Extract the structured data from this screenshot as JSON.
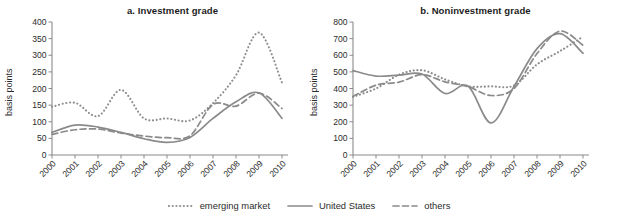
{
  "figure": {
    "yaxis_label": "basis points"
  },
  "legend": {
    "position": "bottom-center",
    "items": [
      {
        "label": "emerging market",
        "style": "dotted",
        "color": "#8e8e8e",
        "icon": "dotted-line-icon"
      },
      {
        "label": "United States",
        "style": "solid",
        "color": "#8a8a8a",
        "icon": "solid-line-icon"
      },
      {
        "label": "others",
        "style": "dashed",
        "color": "#8a8a8a",
        "icon": "dashed-line-icon"
      }
    ]
  },
  "chart_data": [
    {
      "type": "line",
      "title": "a. Investment grade",
      "xlabel": "",
      "ylabel": "basis points",
      "ylim": [
        0,
        400
      ],
      "ytick_step": 50,
      "yticks": [
        0,
        50,
        100,
        150,
        200,
        250,
        300,
        350,
        400
      ],
      "xlim": [
        2000,
        2010
      ],
      "categories": [
        "2000",
        "2001",
        "2002",
        "2003",
        "2004",
        "2005",
        "2006",
        "2007",
        "2008",
        "2009",
        "2010"
      ],
      "x": [
        2000,
        2001,
        2002,
        2003,
        2004,
        2005,
        2006,
        2007,
        2008,
        2009,
        2010
      ],
      "grid": false,
      "legend_position": "bottom-center",
      "series": [
        {
          "name": "emerging market",
          "style": "dotted",
          "values": [
            145,
            157,
            117,
            196,
            110,
            110,
            104,
            156,
            240,
            368,
            218
          ]
        },
        {
          "name": "United States",
          "style": "solid",
          "values": [
            68,
            90,
            84,
            68,
            49,
            38,
            53,
            110,
            160,
            187,
            110
          ]
        },
        {
          "name": "others",
          "style": "dashed",
          "values": [
            62,
            76,
            78,
            66,
            57,
            52,
            58,
            152,
            147,
            186,
            140
          ]
        }
      ]
    },
    {
      "type": "line",
      "title": "b. Noninvestment grade",
      "xlabel": "",
      "ylabel": "basis points",
      "ylim": [
        0,
        800
      ],
      "ytick_step": 100,
      "yticks": [
        0,
        100,
        200,
        300,
        400,
        500,
        600,
        700,
        800
      ],
      "xlim": [
        2000,
        2010
      ],
      "categories": [
        "2000",
        "2001",
        "2002",
        "2003",
        "2004",
        "2005",
        "2006",
        "2007",
        "2008",
        "2009",
        "2010"
      ],
      "x": [
        2000,
        2001,
        2002,
        2003,
        2004,
        2005,
        2006,
        2007,
        2008,
        2009,
        2010
      ],
      "grid": false,
      "legend_position": "bottom-center",
      "series": [
        {
          "name": "emerging market",
          "style": "dotted",
          "values": [
            350,
            400,
            483,
            510,
            455,
            413,
            413,
            418,
            545,
            625,
            712
          ]
        },
        {
          "name": "United States",
          "style": "solid",
          "values": [
            508,
            475,
            480,
            487,
            370,
            415,
            193,
            412,
            640,
            730,
            612
          ]
        },
        {
          "name": "others",
          "style": "dashed",
          "values": [
            352,
            420,
            438,
            483,
            440,
            412,
            358,
            400,
            610,
            745,
            660
          ]
        }
      ]
    }
  ]
}
